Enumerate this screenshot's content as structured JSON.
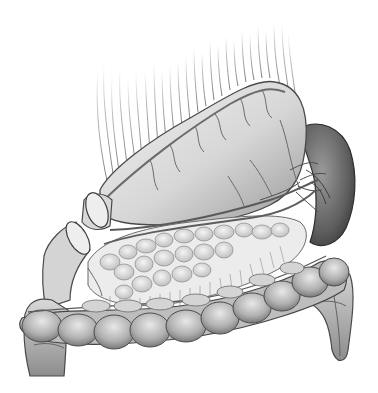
{
  "image": {
    "description": "Grayscale pencil anatomical illustration of upper abdominal organs: stomach with omentum fibers, spleen, pancreas, duodenum and transverse colon",
    "style": "monochrome pencil illustration",
    "background_color": "#ffffff",
    "colors": {
      "organ_light": "#e6e6e6",
      "organ_mid": "#b5b5b5",
      "organ_dark": "#5a5a5a",
      "vessel": "#6b6b6b",
      "outline": "#444444"
    },
    "regions": [
      "omentum-fibers",
      "stomach",
      "spleen",
      "pancreas",
      "duodenum-stump",
      "esophagus-stump",
      "transverse-colon",
      "ascending-colon",
      "descending-colon",
      "blood-vessels"
    ]
  }
}
